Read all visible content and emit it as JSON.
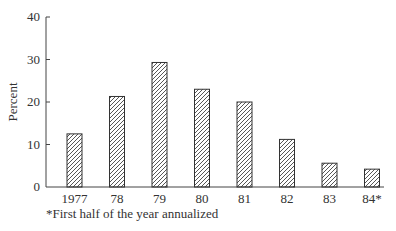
{
  "chart_data": {
    "type": "bar",
    "title": "",
    "xlabel": "",
    "ylabel": "Percent",
    "categories": [
      "1977",
      "78",
      "79",
      "80",
      "81",
      "82",
      "83",
      "84*"
    ],
    "values": [
      12.5,
      21.3,
      29.3,
      23.0,
      20.0,
      11.2,
      5.6,
      4.2
    ],
    "ylim": [
      0,
      40
    ],
    "yticks": [
      0,
      10,
      20,
      30,
      40
    ],
    "ytick_labels": [
      "0",
      "10",
      "20",
      "30",
      "40"
    ],
    "grid": false,
    "legend": null,
    "bar_fill": "diagonal hatch",
    "bar_color": "#333333",
    "footnote": "*First half of the year annualized"
  }
}
